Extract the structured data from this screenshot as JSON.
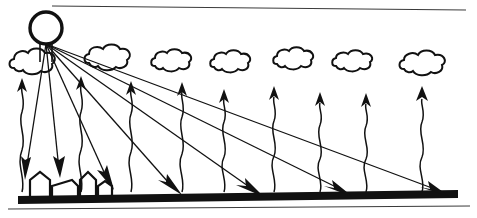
{
  "figure": {
    "caption": "Sun rays strike the ground at varying angles while heat radiates upward toward clouds",
    "width": 477,
    "height": 218,
    "ink_color": "#111111",
    "frame_color": "#3a3a3a",
    "background_color": "#ffffff"
  },
  "frame": {
    "top_border": {
      "x1": 52,
      "y1": 6,
      "x2": 466,
      "y2": 10
    },
    "bottom_border": {
      "x1": 8,
      "y1": 209,
      "x2": 470,
      "y2": 206
    }
  },
  "sun": {
    "label": "sun",
    "cx": 46,
    "cy": 28,
    "r": 16,
    "stroke_width": 3.2,
    "ray_origin": {
      "x": 46,
      "y": 44
    }
  },
  "ground": {
    "label": "ground-bar",
    "left_x": 18,
    "right_x": 458,
    "left_y": 196,
    "right_y": 190,
    "thickness": 8,
    "color": "#111111"
  },
  "buildings": [
    {
      "name": "house-1",
      "x": 30,
      "base": 196,
      "w": 20,
      "h": 18,
      "roof": 8
    },
    {
      "name": "house-2",
      "x": 52,
      "base": 196,
      "w": 26,
      "h": 12,
      "roof": 5
    },
    {
      "name": "house-3",
      "x": 80,
      "base": 196,
      "w": 16,
      "h": 20,
      "roof": 7
    },
    {
      "name": "house-4",
      "x": 98,
      "base": 196,
      "w": 14,
      "h": 12,
      "roof": 5
    }
  ],
  "clouds": [
    {
      "name": "cloud-1",
      "cx": 33,
      "cy": 63,
      "rx": 24,
      "ry": 11
    },
    {
      "name": "cloud-2",
      "cx": 108,
      "cy": 58,
      "rx": 24,
      "ry": 10
    },
    {
      "name": "cloud-3",
      "cx": 172,
      "cy": 62,
      "rx": 21,
      "ry": 10
    },
    {
      "name": "cloud-4",
      "cx": 231,
      "cy": 63,
      "rx": 21,
      "ry": 10
    },
    {
      "name": "cloud-5",
      "cx": 294,
      "cy": 60,
      "rx": 21,
      "ry": 10
    },
    {
      "name": "cloud-6",
      "cx": 353,
      "cy": 62,
      "rx": 21,
      "ry": 9
    },
    {
      "name": "cloud-7",
      "cx": 424,
      "cy": 64,
      "rx": 23,
      "ry": 11
    }
  ],
  "sun_rays": [
    {
      "name": "ray-1",
      "x1": 46,
      "y1": 44,
      "x2": 26,
      "y2": 170,
      "tip_angle": 99
    },
    {
      "name": "ray-2",
      "x1": 46,
      "y1": 44,
      "x2": 59,
      "y2": 168,
      "tip_angle": 84
    },
    {
      "name": "ray-3",
      "x1": 46,
      "y1": 44,
      "x2": 110,
      "y2": 180,
      "tip_angle": 65
    },
    {
      "name": "ray-4",
      "x1": 46,
      "y1": 44,
      "x2": 177,
      "y2": 190,
      "tip_angle": 48
    },
    {
      "name": "ray-5",
      "x1": 46,
      "y1": 44,
      "x2": 258,
      "y2": 193,
      "tip_angle": 37
    },
    {
      "name": "ray-6",
      "x1": 46,
      "y1": 44,
      "x2": 345,
      "y2": 194,
      "tip_angle": 30
    },
    {
      "name": "ray-7",
      "x1": 46,
      "y1": 44,
      "x2": 442,
      "y2": 195,
      "tip_angle": 25
    }
  ],
  "heat_arrows": [
    {
      "name": "heat-arrow-1",
      "x": 22,
      "base": 192,
      "tip": 82
    },
    {
      "name": "heat-arrow-2",
      "x": 81,
      "base": 192,
      "tip": 80
    },
    {
      "name": "heat-arrow-3",
      "x": 131,
      "base": 192,
      "tip": 85
    },
    {
      "name": "heat-arrow-4",
      "x": 182,
      "base": 192,
      "tip": 86
    },
    {
      "name": "heat-arrow-5",
      "x": 224,
      "base": 192,
      "tip": 93
    },
    {
      "name": "heat-arrow-6",
      "x": 274,
      "base": 192,
      "tip": 90
    },
    {
      "name": "heat-arrow-7",
      "x": 320,
      "base": 192,
      "tip": 96
    },
    {
      "name": "heat-arrow-8",
      "x": 366,
      "base": 192,
      "tip": 97
    },
    {
      "name": "heat-arrow-9",
      "x": 422,
      "base": 192,
      "tip": 92
    }
  ]
}
